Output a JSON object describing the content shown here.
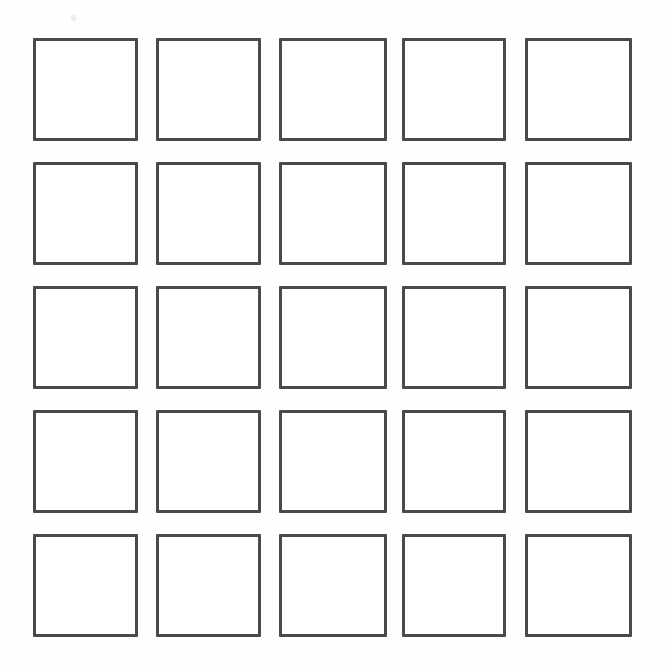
{
  "page": {
    "background_color": "#fefefe",
    "width": 665,
    "height": 672
  },
  "grid": {
    "description": "A 5 by 5 arrangement of empty outlined squares",
    "rows": 5,
    "columns": 5,
    "total_cells": 25,
    "cell_border_color": "#4a4a4c",
    "cell_fill_color": "#ffffff",
    "cell_border_width_px": 3,
    "cell_width_px": 105,
    "cell_height_px": 103,
    "column_gap_px": 18,
    "row_gap_px": 21,
    "origin_x_px": 33,
    "origin_y_px": 38,
    "cells": [
      {
        "row": 1,
        "col": 1,
        "label": ""
      },
      {
        "row": 1,
        "col": 2,
        "label": ""
      },
      {
        "row": 1,
        "col": 3,
        "label": ""
      },
      {
        "row": 1,
        "col": 4,
        "label": ""
      },
      {
        "row": 1,
        "col": 5,
        "label": ""
      },
      {
        "row": 2,
        "col": 1,
        "label": ""
      },
      {
        "row": 2,
        "col": 2,
        "label": ""
      },
      {
        "row": 2,
        "col": 3,
        "label": ""
      },
      {
        "row": 2,
        "col": 4,
        "label": ""
      },
      {
        "row": 2,
        "col": 5,
        "label": ""
      },
      {
        "row": 3,
        "col": 1,
        "label": ""
      },
      {
        "row": 3,
        "col": 2,
        "label": ""
      },
      {
        "row": 3,
        "col": 3,
        "label": ""
      },
      {
        "row": 3,
        "col": 4,
        "label": ""
      },
      {
        "row": 3,
        "col": 5,
        "label": ""
      },
      {
        "row": 4,
        "col": 1,
        "label": ""
      },
      {
        "row": 4,
        "col": 2,
        "label": ""
      },
      {
        "row": 4,
        "col": 3,
        "label": ""
      },
      {
        "row": 4,
        "col": 4,
        "label": ""
      },
      {
        "row": 4,
        "col": 5,
        "label": ""
      },
      {
        "row": 5,
        "col": 1,
        "label": ""
      },
      {
        "row": 5,
        "col": 2,
        "label": ""
      },
      {
        "row": 5,
        "col": 3,
        "label": ""
      },
      {
        "row": 5,
        "col": 4,
        "label": ""
      },
      {
        "row": 5,
        "col": 5,
        "label": ""
      }
    ]
  },
  "artifacts": [
    {
      "name": "scan-speck",
      "x": 71,
      "y": 15,
      "width": 5,
      "height": 6,
      "color": "#e9e9ec"
    }
  ]
}
